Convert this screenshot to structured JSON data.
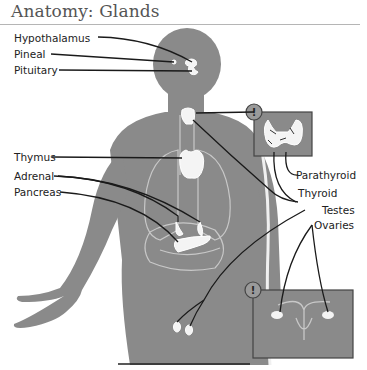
{
  "title": "Anatomy: Glands",
  "labels": {
    "left": [
      "Hypothalamus",
      "Pineal",
      "Pituitary",
      "Thymus",
      "Adrenal",
      "Pancreas"
    ],
    "right": [
      "Parathyroid",
      "Thyroid",
      "Testes",
      "Ovaries"
    ]
  },
  "callouts": [
    {
      "icon": "exclamation-icon",
      "glyph": "!",
      "subject": "thyroid-parathyroid-inset"
    },
    {
      "icon": "exclamation-icon",
      "glyph": "!",
      "subject": "ovaries-uterus-inset"
    }
  ],
  "colors": {
    "body": "#8a8a8a",
    "organ_outline": "#c8c8c8",
    "gland_fill": "#f4f4f4",
    "leader_line": "#1a1a1a",
    "inset_border": "#444444"
  }
}
